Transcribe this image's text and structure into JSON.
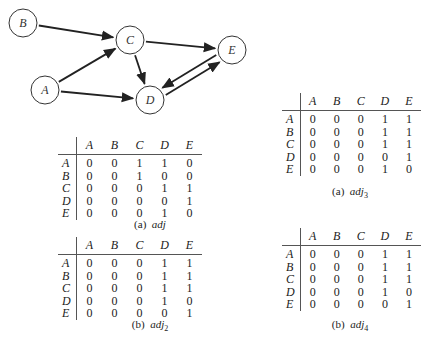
{
  "graph": {
    "nodes": [
      {
        "id": "A",
        "x": 45,
        "y": 90
      },
      {
        "id": "B",
        "x": 23,
        "y": 23
      },
      {
        "id": "C",
        "x": 130,
        "y": 40
      },
      {
        "id": "D",
        "x": 150,
        "y": 100
      },
      {
        "id": "E",
        "x": 232,
        "y": 50
      }
    ],
    "edges": [
      [
        "B",
        "C"
      ],
      [
        "A",
        "C"
      ],
      [
        "A",
        "D"
      ],
      [
        "C",
        "D"
      ],
      [
        "C",
        "E"
      ],
      [
        "E",
        "D"
      ],
      [
        "D",
        "E"
      ]
    ],
    "node_labels": {
      "A": "A",
      "B": "B",
      "C": "C",
      "D": "D",
      "E": "E"
    }
  },
  "matrices": {
    "adj": {
      "caption_prefix": "(a)",
      "caption_name": "adj",
      "caption_sub": "",
      "columns": [
        "A",
        "B",
        "C",
        "D",
        "E"
      ],
      "rows": [
        {
          "label": "A",
          "values": [
            "0",
            "0",
            "1",
            "1",
            "0"
          ]
        },
        {
          "label": "B",
          "values": [
            "0",
            "0",
            "1",
            "0",
            "0"
          ]
        },
        {
          "label": "C",
          "values": [
            "0",
            "0",
            "0",
            "1",
            "1"
          ]
        },
        {
          "label": "D",
          "values": [
            "0",
            "0",
            "0",
            "0",
            "1"
          ]
        },
        {
          "label": "E",
          "values": [
            "0",
            "0",
            "0",
            "1",
            "0"
          ]
        }
      ]
    },
    "adj2": {
      "caption_prefix": "(b)",
      "caption_name": "adj",
      "caption_sub": "2",
      "columns": [
        "A",
        "B",
        "C",
        "D",
        "E"
      ],
      "rows": [
        {
          "label": "A",
          "values": [
            "0",
            "0",
            "0",
            "1",
            "1"
          ]
        },
        {
          "label": "B",
          "values": [
            "0",
            "0",
            "0",
            "1",
            "1"
          ]
        },
        {
          "label": "C",
          "values": [
            "0",
            "0",
            "0",
            "1",
            "1"
          ]
        },
        {
          "label": "D",
          "values": [
            "0",
            "0",
            "0",
            "1",
            "0"
          ]
        },
        {
          "label": "E",
          "values": [
            "0",
            "0",
            "0",
            "0",
            "1"
          ]
        }
      ]
    },
    "adj3": {
      "caption_prefix": "(a)",
      "caption_name": "adj",
      "caption_sub": "3",
      "columns": [
        "A",
        "B",
        "C",
        "D",
        "E"
      ],
      "rows": [
        {
          "label": "A",
          "values": [
            "0",
            "0",
            "0",
            "1",
            "1"
          ]
        },
        {
          "label": "B",
          "values": [
            "0",
            "0",
            "0",
            "1",
            "1"
          ]
        },
        {
          "label": "C",
          "values": [
            "0",
            "0",
            "0",
            "1",
            "1"
          ]
        },
        {
          "label": "D",
          "values": [
            "0",
            "0",
            "0",
            "0",
            "1"
          ]
        },
        {
          "label": "E",
          "values": [
            "0",
            "0",
            "0",
            "1",
            "0"
          ]
        }
      ]
    },
    "adj4": {
      "caption_prefix": "(b)",
      "caption_name": "adj",
      "caption_sub": "4",
      "columns": [
        "A",
        "B",
        "C",
        "D",
        "E"
      ],
      "rows": [
        {
          "label": "A",
          "values": [
            "0",
            "0",
            "0",
            "1",
            "1"
          ]
        },
        {
          "label": "B",
          "values": [
            "0",
            "0",
            "0",
            "1",
            "1"
          ]
        },
        {
          "label": "C",
          "values": [
            "0",
            "0",
            "0",
            "1",
            "1"
          ]
        },
        {
          "label": "D",
          "values": [
            "0",
            "0",
            "0",
            "1",
            "0"
          ]
        },
        {
          "label": "E",
          "values": [
            "0",
            "0",
            "0",
            "0",
            "1"
          ]
        }
      ]
    }
  }
}
